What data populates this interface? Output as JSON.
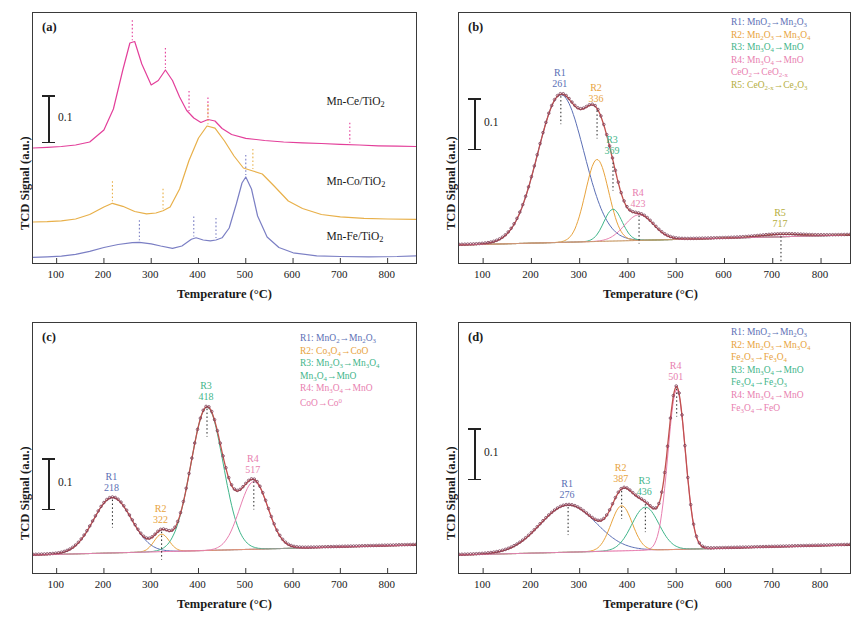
{
  "figure": {
    "axis": {
      "xlabel": "Temperature (°C)",
      "ylabel": "TCD Signal (a.u.)",
      "xticks": [
        "100",
        "200",
        "300",
        "400",
        "500",
        "600",
        "700",
        "800"
      ],
      "xlim": [
        50,
        860
      ],
      "scalebar_value": "0.1"
    },
    "colors": {
      "r1": "#5b6fb5",
      "r2": "#e8a33d",
      "r3": "#3fb58a",
      "r4": "#e87fb0",
      "r5": "#b5ae3d",
      "fit": "#c0504d",
      "data": "#7a3b55",
      "ce_curve": "#e33f9a",
      "co_curve": "#e8b04a",
      "fe_curve": "#7b7fc4",
      "axis": "#3a3a3a"
    }
  },
  "chart_data": [
    {
      "type": "line",
      "panel": "a",
      "tag": "(a)",
      "title": "H2-TPR profiles of Mn-Ce/TiO2, Mn-Co/TiO2 and Mn-Fe/TiO2",
      "xlabel": "Temperature (°C)",
      "ylabel": "TCD Signal (a.u.)",
      "xlim": [
        50,
        860
      ],
      "xticks": [
        100,
        200,
        300,
        400,
        500,
        600,
        700,
        800
      ],
      "grid": false,
      "legend_position": "inline-right",
      "series": [
        {
          "name": "Mn-Ce/TiO2",
          "label": "Mn-Ce/TiO₂",
          "color": "#e33f9a",
          "label_x": 690,
          "peaks": [
            260,
            330,
            380,
            420,
            720
          ],
          "x": [
            50,
            80,
            110,
            140,
            170,
            200,
            220,
            240,
            255,
            265,
            280,
            300,
            315,
            330,
            345,
            360,
            375,
            390,
            405,
            420,
            435,
            450,
            470,
            500,
            540,
            580,
            620,
            660,
            700,
            740,
            780,
            820,
            860
          ],
          "y": [
            0.1,
            0.105,
            0.11,
            0.12,
            0.14,
            0.22,
            0.36,
            0.62,
            0.8,
            0.81,
            0.66,
            0.52,
            0.55,
            0.62,
            0.55,
            0.44,
            0.35,
            0.3,
            0.27,
            0.29,
            0.28,
            0.23,
            0.19,
            0.165,
            0.15,
            0.14,
            0.135,
            0.13,
            0.125,
            0.12,
            0.115,
            0.112,
            0.11
          ]
        },
        {
          "name": "Mn-Co/TiO2",
          "label": "Mn-Co/TiO₂",
          "color": "#e8b04a",
          "label_x": 690,
          "peaks": [
            218,
            325,
            420,
            515
          ],
          "x": [
            50,
            80,
            110,
            140,
            170,
            200,
            218,
            240,
            265,
            290,
            310,
            325,
            340,
            360,
            380,
            400,
            418,
            435,
            455,
            475,
            495,
            515,
            535,
            560,
            590,
            620,
            660,
            700,
            750,
            800,
            860
          ],
          "y": [
            0.06,
            0.062,
            0.068,
            0.08,
            0.11,
            0.16,
            0.185,
            0.165,
            0.13,
            0.115,
            0.12,
            0.135,
            0.16,
            0.28,
            0.47,
            0.62,
            0.7,
            0.685,
            0.6,
            0.5,
            0.42,
            0.4,
            0.38,
            0.3,
            0.2,
            0.15,
            0.11,
            0.095,
            0.085,
            0.08,
            0.078
          ]
        },
        {
          "name": "Mn-Fe/TiO2",
          "label": "Mn-Fe/TiO₂",
          "color": "#7b7fc4",
          "label_x": 690,
          "peaks": [
            275,
            390,
            437,
            500
          ],
          "x": [
            50,
            80,
            110,
            140,
            170,
            200,
            230,
            260,
            275,
            300,
            320,
            345,
            365,
            385,
            395,
            410,
            425,
            437,
            450,
            465,
            480,
            492,
            500,
            512,
            525,
            545,
            570,
            600,
            650,
            700,
            760,
            820,
            860
          ],
          "y": [
            0.025,
            0.028,
            0.033,
            0.045,
            0.065,
            0.09,
            0.11,
            0.122,
            0.125,
            0.115,
            0.1,
            0.085,
            0.1,
            0.145,
            0.155,
            0.14,
            0.135,
            0.14,
            0.155,
            0.22,
            0.38,
            0.52,
            0.56,
            0.48,
            0.3,
            0.16,
            0.09,
            0.055,
            0.035,
            0.03,
            0.028,
            0.03,
            0.035
          ]
        }
      ]
    },
    {
      "type": "line",
      "panel": "b",
      "tag": "(b)",
      "title": "H2-TPR deconvolution of Mn-Ce/TiO2",
      "xlabel": "Temperature (°C)",
      "ylabel": "TCD Signal (a.u.)",
      "xlim": [
        50,
        860
      ],
      "xticks": [
        100,
        200,
        300,
        400,
        500,
        600,
        700,
        800
      ],
      "grid": false,
      "legend_position": "top-right",
      "peaks": [
        {
          "id": "R1",
          "temperature": "261",
          "color": "#5b6fb5",
          "center": 261,
          "height": 0.72,
          "width": 48
        },
        {
          "id": "R2",
          "temperature": "336",
          "color": "#e8a33d",
          "center": 336,
          "height": 0.4,
          "width": 24
        },
        {
          "id": "R3",
          "temperature": "369",
          "color": "#3fb58a",
          "center": 369,
          "height": 0.155,
          "width": 19
        },
        {
          "id": "R4",
          "temperature": "423",
          "color": "#e87fb0",
          "center": 423,
          "height": 0.125,
          "width": 30
        },
        {
          "id": "R5",
          "temperature": "717",
          "color": "#b5ae3d",
          "center": 717,
          "height": 0.012,
          "width": 42
        }
      ],
      "legend": [
        {
          "id": "R1",
          "text": "R1: MnO₂→Mn₂O₃",
          "color": "#5b6fb5"
        },
        {
          "id": "R2",
          "text": "R2: Mn₂O₃→Mn₃O₄",
          "color": "#e8a33d"
        },
        {
          "id": "R3",
          "text": "R3: Mn₃O₄→MnO",
          "color": "#3fb58a"
        },
        {
          "id": "R4",
          "text": "R4: Mn₃O₄→MnO",
          "color": "#e87fb0"
        },
        {
          "id": "R4b",
          "text": "CeO₂→CeO₂₋ₓ",
          "color": "#e87fb0"
        },
        {
          "id": "R5",
          "text": "R5: CeO₂₋ₓ→Ce₂O₃",
          "color": "#b5ae3d"
        }
      ]
    },
    {
      "type": "line",
      "panel": "c",
      "tag": "(c)",
      "title": "H2-TPR deconvolution of Mn-Co/TiO2",
      "xlabel": "Temperature (°C)",
      "ylabel": "TCD Signal (a.u.)",
      "xlim": [
        50,
        860
      ],
      "xticks": [
        100,
        200,
        300,
        400,
        500,
        600,
        700,
        800
      ],
      "grid": false,
      "legend_position": "top-right",
      "peaks": [
        {
          "id": "R1",
          "temperature": "218",
          "color": "#5b6fb5",
          "center": 218,
          "height": 0.27,
          "width": 40
        },
        {
          "id": "R2",
          "temperature": "322",
          "color": "#e8a33d",
          "center": 322,
          "height": 0.085,
          "width": 16
        },
        {
          "id": "R3",
          "temperature": "418",
          "color": "#3fb58a",
          "center": 418,
          "height": 0.7,
          "width": 34
        },
        {
          "id": "R4",
          "temperature": "517",
          "color": "#e87fb0",
          "center": 517,
          "height": 0.33,
          "width": 30
        }
      ],
      "legend": [
        {
          "id": "R1",
          "text": "R1: MnO₂→Mn₂O₃",
          "color": "#5b6fb5"
        },
        {
          "id": "R2",
          "text": "R2: Co₃O₄→CoO",
          "color": "#e8a33d"
        },
        {
          "id": "R3",
          "text": "R3: Mn₂O₃→Mn₃O₄",
          "color": "#3fb58a"
        },
        {
          "id": "R3b",
          "text": "Mn₃O₄→MnO",
          "color": "#3fb58a"
        },
        {
          "id": "R4",
          "text": "R4: Mn₃O₄→MnO",
          "color": "#e87fb0"
        },
        {
          "id": "R4b",
          "text": "CoO→Co⁰",
          "color": "#e87fb0"
        }
      ]
    },
    {
      "type": "line",
      "panel": "d",
      "tag": "(d)",
      "title": "H2-TPR deconvolution of Mn-Fe/TiO2",
      "xlabel": "Temperature (°C)",
      "ylabel": "TCD Signal (a.u.)",
      "xlim": [
        50,
        860
      ],
      "xticks": [
        100,
        200,
        300,
        400,
        500,
        600,
        700,
        800
      ],
      "grid": false,
      "legend_position": "top-right",
      "peaks": [
        {
          "id": "R1",
          "temperature": "276",
          "color": "#5b6fb5",
          "center": 276,
          "height": 0.23,
          "width": 58
        },
        {
          "id": "R2",
          "temperature": "387",
          "color": "#e8a33d",
          "center": 387,
          "height": 0.22,
          "width": 22
        },
        {
          "id": "R3",
          "temperature": "436",
          "color": "#3fb58a",
          "center": 436,
          "height": 0.21,
          "width": 28
        },
        {
          "id": "R4",
          "temperature": "501",
          "color": "#e87fb0",
          "center": 501,
          "height": 0.78,
          "width": 18
        }
      ],
      "legend": [
        {
          "id": "R1",
          "text": "R1: MnO₂→Mn₂O₃",
          "color": "#5b6fb5"
        },
        {
          "id": "R2",
          "text": "R2: Mn₂O₃→Mn₃O₄",
          "color": "#e8a33d"
        },
        {
          "id": "R2b",
          "text": "Fe₂O₃→Fe₃O₄",
          "color": "#e8a33d"
        },
        {
          "id": "R3",
          "text": "R3: Mn₃O₄→MnO",
          "color": "#3fb58a"
        },
        {
          "id": "R3b",
          "text": "Fe₃O₄→Fe₂O₃",
          "color": "#3fb58a"
        },
        {
          "id": "R4",
          "text": "R4: Mn₃O₄→MnO",
          "color": "#e87fb0"
        },
        {
          "id": "R4b",
          "text": "Fe₃O₄→FeO",
          "color": "#e87fb0"
        }
      ]
    }
  ]
}
